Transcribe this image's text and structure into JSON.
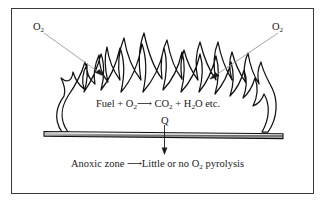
{
  "figure": {
    "border_color": "#3a3a3a",
    "background": "#ffffff",
    "flame_stroke": "#111111",
    "leader_color": "#9a9a9a",
    "arrow_color": "#1a1a1a",
    "slab_edge": "#111111",
    "slab_fill_light": "#f2f2f2",
    "slab_fill_mid": "#8e8e8e"
  },
  "labels": {
    "o2_left": "O",
    "o2_left_sub": "2",
    "o2_right": "O",
    "o2_right_sub": "2",
    "heat": "Q"
  },
  "reaction": {
    "reactants": "Fuel + O",
    "reactants_sub": "2",
    "arrow": "⟶",
    "product_1": "CO",
    "product_1_sub": "2",
    "plus": "+ H",
    "product_2_sub": "2",
    "product_2_tail": "O etc."
  },
  "anoxic": {
    "zone": "Anoxic zone",
    "arrow": "⟶",
    "result_pre": "Little or no O",
    "result_sub": "2",
    "result_post": " pyrolysis"
  },
  "diagram_data": {
    "type": "schematic",
    "elements": [
      "flame-outline",
      "substrate-slab",
      "oxygen-leader-left",
      "oxygen-leader-right",
      "heat-arrow-down"
    ],
    "slab": {
      "x1": 44,
      "y1": 132,
      "x2": 283,
      "y2": 136
    },
    "flame_base_left": 60,
    "flame_base_right": 270,
    "flame_peak_top": 26
  }
}
